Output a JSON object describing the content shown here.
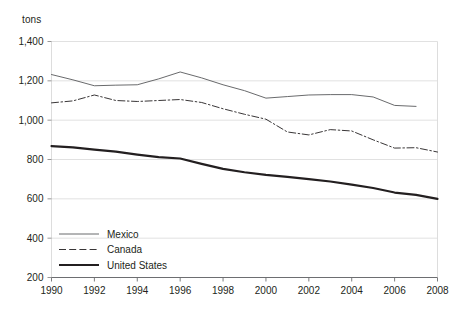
{
  "chart_data": {
    "type": "line",
    "title": "",
    "subtitle": "",
    "xlabel": "",
    "ylabel": "tons",
    "unit_label": "tons",
    "xlim": [
      1990,
      2008
    ],
    "ylim": [
      200,
      1400
    ],
    "ytick_values": [
      200,
      400,
      600,
      800,
      1000,
      1200,
      1400
    ],
    "ytick_labels": [
      "200",
      "400",
      "600",
      "800",
      "1,000",
      "1,200",
      "1,400"
    ],
    "xtick_values": [
      1990,
      1992,
      1994,
      1996,
      1998,
      2000,
      2002,
      2004,
      2006,
      2008
    ],
    "xtick_labels": [
      "1990",
      "1992",
      "1994",
      "1996",
      "1998",
      "2000",
      "2002",
      "2004",
      "2006",
      "2008"
    ],
    "grid": true,
    "grid_axis": "y",
    "legend_position": "bottom-left",
    "x": [
      1990,
      1991,
      1992,
      1993,
      1994,
      1995,
      1996,
      1997,
      1998,
      1999,
      2000,
      2001,
      2002,
      2003,
      2004,
      2005,
      2006,
      2007,
      2008
    ],
    "series": [
      {
        "name": "Mexico",
        "style": "solid-thin",
        "color": "#58595b",
        "x": [
          1990,
          1991,
          1992,
          1993,
          1994,
          1995,
          1996,
          1997,
          1998,
          1999,
          2000,
          2001,
          2002,
          2003,
          2004,
          2005,
          2006,
          2007
        ],
        "values": [
          1232,
          1205,
          1175,
          1178,
          1180,
          1210,
          1245,
          1215,
          1180,
          1150,
          1112,
          1120,
          1128,
          1130,
          1130,
          1118,
          1075,
          1070
        ]
      },
      {
        "name": "Canada",
        "style": "dash-dot",
        "color": "#231f20",
        "x": [
          1990,
          1991,
          1992,
          1993,
          1994,
          1995,
          1996,
          1997,
          1998,
          1999,
          2000,
          2001,
          2002,
          2003,
          2004,
          2005,
          2006,
          2007,
          2008
        ],
        "values": [
          1088,
          1098,
          1128,
          1100,
          1095,
          1100,
          1105,
          1090,
          1058,
          1030,
          1005,
          940,
          925,
          952,
          945,
          900,
          858,
          860,
          838
        ]
      },
      {
        "name": "United States",
        "style": "solid-thick",
        "color": "#231f20",
        "x": [
          1990,
          1991,
          1992,
          1993,
          1994,
          1995,
          1996,
          1997,
          1998,
          1999,
          2000,
          2001,
          2002,
          2003,
          2004,
          2005,
          2006,
          2007,
          2008
        ],
        "values": [
          868,
          862,
          850,
          840,
          825,
          812,
          805,
          778,
          752,
          735,
          722,
          712,
          700,
          688,
          672,
          655,
          632,
          620,
          600
        ]
      }
    ],
    "legend": [
      {
        "label": "Mexico",
        "style": "solid-thin"
      },
      {
        "label": "Canada",
        "style": "dash-dot"
      },
      {
        "label": "United States",
        "style": "solid-thick"
      }
    ],
    "colors": {
      "axis": "#231f20",
      "grid": "#d9d9d9",
      "mexico": "#58595b",
      "canada": "#231f20",
      "united_states": "#231f20",
      "background": "#ffffff"
    }
  }
}
